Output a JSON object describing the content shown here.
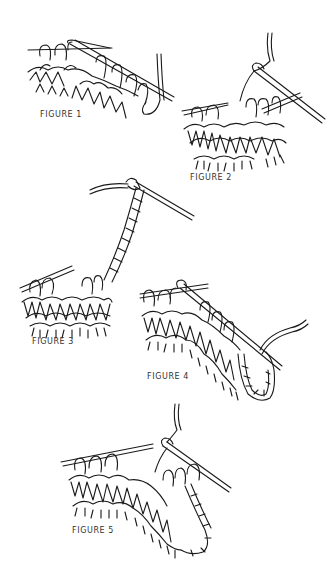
{
  "figures": [
    {
      "id": 1,
      "label": "FIGURE 1",
      "depicts": "stitches-on-needle-with-yarn"
    },
    {
      "id": 2,
      "label": "FIGURE 2",
      "depicts": "needle-inserted-yarn-wrapped"
    },
    {
      "id": 3,
      "label": "FIGURE 3",
      "depicts": "crochet-chain-rising-from-knitting"
    },
    {
      "id": 4,
      "label": "FIGURE 4",
      "depicts": "chain-loop-picked-up-onto-needle"
    },
    {
      "id": 5,
      "label": "FIGURE 5",
      "depicts": "loop-joined-and-knitting-continued"
    }
  ],
  "colors": {
    "line": "#1a1a1a",
    "background": "#ffffff",
    "label": "#333333"
  }
}
